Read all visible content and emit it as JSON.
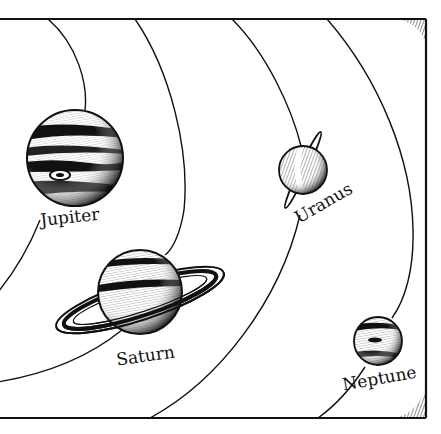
{
  "diagram": {
    "type": "solar-system-outer-planets-illustration",
    "style": "pen-and-ink engraving",
    "colors": {
      "ink": "#111111",
      "paper": "#ffffff"
    },
    "frame": {
      "sides": [
        "top",
        "right",
        "bottom"
      ]
    },
    "orbits": 4,
    "planets": [
      {
        "name": "Jupiter",
        "label": "Jupiter",
        "has_rings": false,
        "feature": "great-red-spot"
      },
      {
        "name": "Saturn",
        "label": "Saturn",
        "has_rings": true
      },
      {
        "name": "Uranus",
        "label": "Uranus",
        "has_rings": true,
        "ring_orientation": "near-vertical"
      },
      {
        "name": "Neptune",
        "label": "Neptune",
        "has_rings": false,
        "feature": "dark-spot"
      }
    ]
  }
}
